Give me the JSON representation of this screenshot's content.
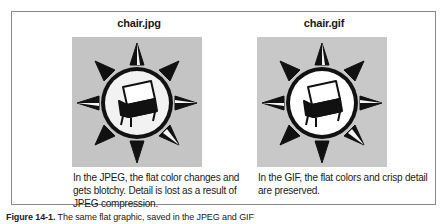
{
  "figure": {
    "panels": [
      {
        "title": "chair.jpg",
        "image_icon": "compass-chair-icon",
        "description": "In the JPEG, the flat color changes and gets blotchy. Detail is lost as a result of JPEG compression."
      },
      {
        "title": "chair.gif",
        "image_icon": "compass-chair-icon",
        "description": "In the GIF, the flat colors and crisp detail are preserved."
      }
    ],
    "caption_label": "Figure 14-1.",
    "caption_text": "The same flat graphic, saved in the JPEG and GIF"
  },
  "colors": {
    "frame_border": "#8a8a8a",
    "image_background": "#c8c8c8",
    "text": "#1a1a1a"
  }
}
